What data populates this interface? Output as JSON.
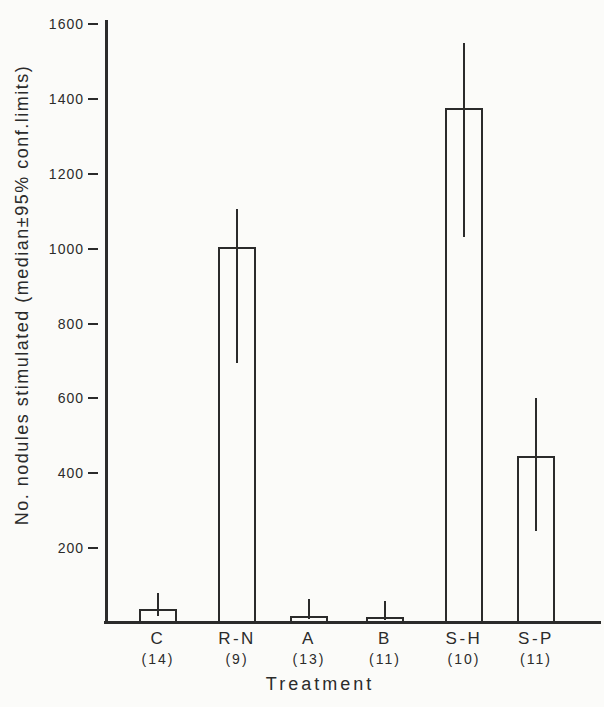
{
  "figure": {
    "background": "#fbfbf9",
    "ink_color": "#2b2b2b"
  },
  "chart_data": {
    "type": "bar",
    "title": "",
    "xlabel": "Treatment",
    "ylabel": "No. nodules stimulated (median±95% conf.limits)",
    "ylim": [
      0,
      1600
    ],
    "yticks": [
      200,
      400,
      600,
      800,
      1000,
      1200,
      1400,
      1600
    ],
    "grid": false,
    "legend": false,
    "bar_fill": "none",
    "error_bar_meaning": "95% confidence limits",
    "categories": [
      "C",
      "R-N",
      "A",
      "B",
      "S-H",
      "S-P"
    ],
    "n_labels": [
      "(14)",
      "(9)",
      "(13)",
      "(11)",
      "(10)",
      "(11)"
    ],
    "values": [
      38,
      1005,
      20,
      15,
      1375,
      445
    ],
    "ci_low": [
      20,
      695,
      10,
      8,
      1030,
      245
    ],
    "ci_high": [
      80,
      1105,
      65,
      58,
      1550,
      600
    ]
  }
}
